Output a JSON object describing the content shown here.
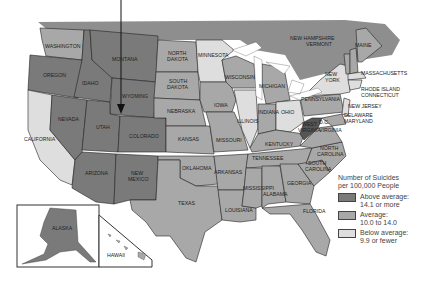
{
  "map": {
    "title": "Number of Suicides per 100,000 People",
    "colors": {
      "above": "#7a7a7a",
      "average": "#a8a8a8",
      "below": "#dedede",
      "water": "#ffffff",
      "canada": "#8e8e8e"
    },
    "states": [
      {
        "name": "WASHINGTON",
        "category": "average"
      },
      {
        "name": "OREGON",
        "category": "above"
      },
      {
        "name": "CALIFORNIA",
        "category": "below"
      },
      {
        "name": "IDAHO",
        "category": "above"
      },
      {
        "name": "NEVADA",
        "category": "above"
      },
      {
        "name": "MONTANA",
        "category": "above"
      },
      {
        "name": "WYOMING",
        "category": "above"
      },
      {
        "name": "UTAH",
        "category": "above"
      },
      {
        "name": "COLORADO",
        "category": "above"
      },
      {
        "name": "ARIZONA",
        "category": "above"
      },
      {
        "name": "NEW MEXICO",
        "category": "above"
      },
      {
        "name": "NORTH DAKOTA",
        "category": "average"
      },
      {
        "name": "SOUTH DAKOTA",
        "category": "average"
      },
      {
        "name": "NEBRASKA",
        "category": "average"
      },
      {
        "name": "KANSAS",
        "category": "average"
      },
      {
        "name": "OKLAHOMA",
        "category": "average"
      },
      {
        "name": "TEXAS",
        "category": "average"
      },
      {
        "name": "MINNESOTA",
        "category": "below"
      },
      {
        "name": "IOWA",
        "category": "average"
      },
      {
        "name": "MISSOURI",
        "category": "average"
      },
      {
        "name": "ARKANSAS",
        "category": "average"
      },
      {
        "name": "LOUISIANA",
        "category": "average"
      },
      {
        "name": "WISCONSIN",
        "category": "average"
      },
      {
        "name": "ILLINOIS",
        "category": "below"
      },
      {
        "name": "MICHIGAN",
        "category": "average"
      },
      {
        "name": "INDIANA",
        "category": "average"
      },
      {
        "name": "OHIO",
        "category": "below"
      },
      {
        "name": "KENTUCKY",
        "category": "average"
      },
      {
        "name": "TENNESSEE",
        "category": "average"
      },
      {
        "name": "MISSISSIPPI",
        "category": "average"
      },
      {
        "name": "ALABAMA",
        "category": "average"
      },
      {
        "name": "GEORGIA",
        "category": "average"
      },
      {
        "name": "FLORIDA",
        "category": "average"
      },
      {
        "name": "SOUTH CAROLINA",
        "category": "average"
      },
      {
        "name": "NORTH CAROLINA",
        "category": "average"
      },
      {
        "name": "VIRGINIA",
        "category": "average"
      },
      {
        "name": "WEST VIRGINIA",
        "category": "above"
      },
      {
        "name": "PENNSYLVANIA",
        "category": "average"
      },
      {
        "name": "NEW YORK",
        "category": "below"
      },
      {
        "name": "NEW JERSEY",
        "category": "below"
      },
      {
        "name": "DELAWARE",
        "category": "average"
      },
      {
        "name": "MARYLAND",
        "category": "average"
      },
      {
        "name": "D.C.",
        "category": "average"
      },
      {
        "name": "CONNECTICUT",
        "category": "below"
      },
      {
        "name": "RHODE ISLAND",
        "category": "below"
      },
      {
        "name": "MASSACHUSETTS",
        "category": "below"
      },
      {
        "name": "VERMONT",
        "category": "average"
      },
      {
        "name": "NEW HAMPSHIRE",
        "category": "average"
      },
      {
        "name": "MAINE",
        "category": "average"
      },
      {
        "name": "ALASKA",
        "category": "above"
      },
      {
        "name": "HAWAII",
        "category": "average"
      }
    ],
    "labels": {
      "washington": "WASHINGTON",
      "oregon": "OREGON",
      "california": "CALIFORNIA",
      "idaho": "IDAHO",
      "nevada": "NEVADA",
      "montana": "MONTANA",
      "wyoming": "WYOMING",
      "utah": "UTAH",
      "colorado": "COLORADO",
      "arizona": "ARIZONA",
      "new_mexico_1": "NEW",
      "new_mexico_2": "MEXICO",
      "north_dakota_1": "NORTH",
      "north_dakota_2": "DAKOTA",
      "south_dakota_1": "SOUTH",
      "south_dakota_2": "DAKOTA",
      "nebraska": "NEBRASKA",
      "kansas": "KANSAS",
      "oklahoma": "OKLAHOMA",
      "texas": "TEXAS",
      "minnesota": "MINNESOTA",
      "iowa": "IOWA",
      "missouri": "MISSOURI",
      "arkansas": "ARKANSAS",
      "louisiana": "LOUISIANA",
      "wisconsin": "WISCONSIN",
      "illinois": "ILLINOIS",
      "michigan": "MICHIGAN",
      "indiana": "INDIANA",
      "ohio": "OHIO",
      "kentucky": "KENTUCKY",
      "tennessee": "TENNESSEE",
      "mississippi": "MISSISSIPPI",
      "alabama": "ALABAMA",
      "georgia": "GEORGIA",
      "florida": "FLORIDA",
      "south_carolina_1": "SOUTH",
      "south_carolina_2": "CAROLINA",
      "north_carolina_1": "NORTH",
      "north_carolina_2": "CAROLINA",
      "virginia": "VIRGINIA",
      "west_virginia_1": "WEST",
      "west_virginia_2": "VIRGINIA",
      "dc": "D.C.",
      "pennsylvania": "PENNSYLVANIA",
      "new_york_1": "NEW",
      "new_york_2": "YORK",
      "new_jersey": "NEW JERSEY",
      "delaware": "DELAWARE",
      "maryland": "MARYLAND",
      "rhode_island": "RHODE ISLAND",
      "connecticut": "CONNECTICUT",
      "massachusetts": "MASSACHUSETTS",
      "new_hampshire": "NEW HAMPSHIRE",
      "vermont": "VERMONT",
      "maine": "MAINE",
      "alaska": "ALASKA",
      "hawaii": "HAWAII"
    },
    "legend": {
      "title_line1": "Number of Suicides",
      "title_line2": "per 100,000 People",
      "items": [
        {
          "label1": "Above average:",
          "label2": "14.1 or more",
          "color": "#7a7a7a"
        },
        {
          "label1": "Average:",
          "label2": "10.0 to 14.0",
          "color": "#a8a8a8"
        },
        {
          "label1": "Below average:",
          "label2": "9.9 or fewer",
          "color": "#dedede"
        }
      ]
    },
    "pointer_arrow": {
      "target": "WYOMING / COLORADO border",
      "direction": "down"
    }
  }
}
